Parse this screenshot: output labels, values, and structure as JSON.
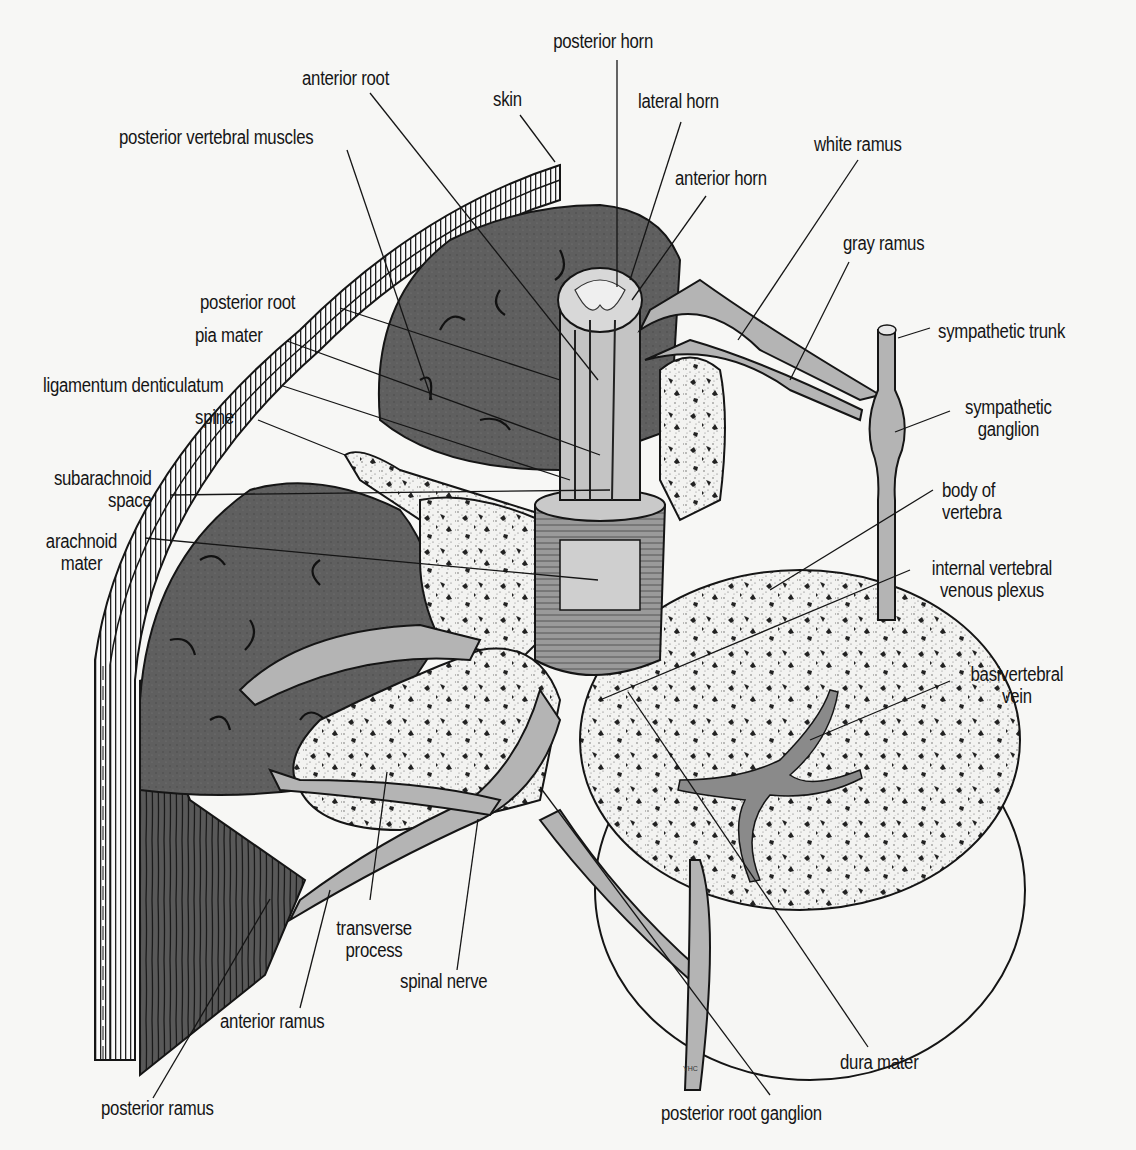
{
  "figure": {
    "colors": {
      "background": "#f7f7f5",
      "muscle": "#5e5e5e",
      "nerve": "#b4b4b4",
      "bone": "#f2f2f0",
      "line": "#151515"
    },
    "signature": "YHC"
  },
  "labels": {
    "posterior_horn": "posterior horn",
    "anterior_root": "anterior root",
    "skin": "skin",
    "lateral_horn": "lateral horn",
    "posterior_vertebral_muscles": "posterior vertebral muscles",
    "white_ramus": "white ramus",
    "anterior_horn": "anterior horn",
    "gray_ramus": "gray ramus",
    "posterior_root": "posterior root",
    "pia_mater": "pia mater",
    "sympathetic_trunk": "sympathetic trunk",
    "ligamentum_denticulatum": "ligamentum denticulatum",
    "sympathetic_ganglion": [
      "sympathetic",
      "ganglion"
    ],
    "spine": "spine",
    "subarachnoid_space": [
      "subarachnoid",
      "space"
    ],
    "body_of_vertebra": [
      "body of",
      "vertebra"
    ],
    "arachnoid_mater": [
      "arachnoid",
      "mater"
    ],
    "internal_vertebral_venous_plexus": [
      "internal vertebral",
      "venous plexus"
    ],
    "basivertebral_vein": [
      "basivertebral",
      "vein"
    ],
    "transverse_process": [
      "transverse",
      "process"
    ],
    "spinal_nerve": "spinal nerve",
    "anterior_ramus": "anterior ramus",
    "dura_mater": "dura mater",
    "posterior_ramus": "posterior ramus",
    "posterior_root_ganglion": "posterior root ganglion"
  }
}
